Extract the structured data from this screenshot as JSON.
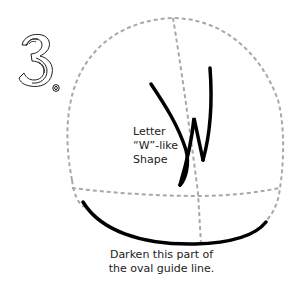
{
  "step": {
    "number": "3."
  },
  "annotations": {
    "w_shape": {
      "lines": [
        "Letter",
        "“W”-like",
        "Shape"
      ]
    },
    "bottom_note": {
      "lines": [
        "Darken this part of",
        "the oval guide line."
      ]
    }
  },
  "colors": {
    "guide_dashed": "#a8a8a8",
    "ink": "#000000",
    "text": "#222222",
    "background": "#ffffff"
  }
}
